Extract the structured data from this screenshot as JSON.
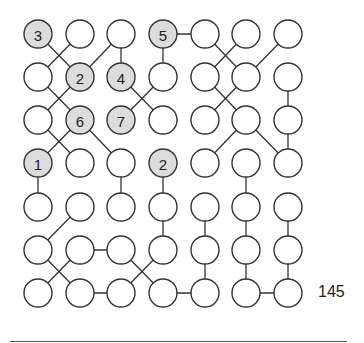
{
  "puzzle": {
    "type": "number-link grid",
    "rows": 7,
    "cols": 7,
    "col_x": [
      38,
      80,
      121,
      163,
      205,
      246,
      288
    ],
    "row_y": [
      34,
      77,
      120,
      163,
      207,
      250,
      293
    ],
    "radius": 14,
    "colors": {
      "shaded_fill": "#dcdcdc",
      "stroke": "#333333",
      "empty_fill": "#ffffff"
    },
    "clues": [
      {
        "r": 0,
        "c": 0,
        "value": "3"
      },
      {
        "r": 0,
        "c": 3,
        "value": "5"
      },
      {
        "r": 1,
        "c": 1,
        "value": "2"
      },
      {
        "r": 1,
        "c": 2,
        "value": "4"
      },
      {
        "r": 2,
        "c": 1,
        "value": "6"
      },
      {
        "r": 2,
        "c": 2,
        "value": "7"
      },
      {
        "r": 3,
        "c": 0,
        "value": "1"
      },
      {
        "r": 3,
        "c": 3,
        "value": "2"
      }
    ],
    "edges": [
      [
        [
          0,
          0
        ],
        [
          1,
          1
        ]
      ],
      [
        [
          0,
          1
        ],
        [
          1,
          0
        ]
      ],
      [
        [
          0,
          2
        ],
        [
          1,
          1
        ]
      ],
      [
        [
          0,
          2
        ],
        [
          1,
          2
        ]
      ],
      [
        [
          0,
          3
        ],
        [
          0,
          4
        ]
      ],
      [
        [
          0,
          3
        ],
        [
          1,
          3
        ]
      ],
      [
        [
          0,
          4
        ],
        [
          1,
          5
        ]
      ],
      [
        [
          0,
          5
        ],
        [
          1,
          4
        ]
      ],
      [
        [
          0,
          6
        ],
        [
          1,
          5
        ]
      ],
      [
        [
          1,
          0
        ],
        [
          2,
          1
        ]
      ],
      [
        [
          1,
          1
        ],
        [
          2,
          0
        ]
      ],
      [
        [
          1,
          2
        ],
        [
          2,
          3
        ]
      ],
      [
        [
          1,
          3
        ],
        [
          2,
          2
        ]
      ],
      [
        [
          1,
          4
        ],
        [
          2,
          5
        ]
      ],
      [
        [
          1,
          5
        ],
        [
          2,
          4
        ]
      ],
      [
        [
          1,
          6
        ],
        [
          2,
          6
        ]
      ],
      [
        [
          2,
          1
        ],
        [
          3,
          0
        ]
      ],
      [
        [
          2,
          0
        ],
        [
          3,
          1
        ]
      ],
      [
        [
          2,
          1
        ],
        [
          3,
          2
        ]
      ],
      [
        [
          2,
          5
        ],
        [
          3,
          4
        ]
      ],
      [
        [
          2,
          5
        ],
        [
          3,
          6
        ]
      ],
      [
        [
          2,
          6
        ],
        [
          3,
          6
        ]
      ],
      [
        [
          3,
          0
        ],
        [
          4,
          0
        ]
      ],
      [
        [
          3,
          2
        ],
        [
          4,
          2
        ]
      ],
      [
        [
          3,
          3
        ],
        [
          4,
          3
        ]
      ],
      [
        [
          3,
          5
        ],
        [
          4,
          5
        ]
      ],
      [
        [
          4,
          1
        ],
        [
          5,
          0
        ]
      ],
      [
        [
          4,
          3
        ],
        [
          5,
          3
        ]
      ],
      [
        [
          4,
          4
        ],
        [
          5,
          4
        ]
      ],
      [
        [
          4,
          5
        ],
        [
          5,
          5
        ]
      ],
      [
        [
          4,
          6
        ],
        [
          5,
          6
        ]
      ],
      [
        [
          5,
          0
        ],
        [
          6,
          1
        ]
      ],
      [
        [
          5,
          1
        ],
        [
          6,
          0
        ]
      ],
      [
        [
          5,
          1
        ],
        [
          5,
          2
        ]
      ],
      [
        [
          5,
          2
        ],
        [
          6,
          3
        ]
      ],
      [
        [
          5,
          3
        ],
        [
          6,
          2
        ]
      ],
      [
        [
          5,
          4
        ],
        [
          6,
          4
        ]
      ],
      [
        [
          5,
          5
        ],
        [
          6,
          5
        ]
      ],
      [
        [
          5,
          6
        ],
        [
          6,
          6
        ]
      ],
      [
        [
          6,
          1
        ],
        [
          6,
          2
        ]
      ],
      [
        [
          6,
          3
        ],
        [
          6,
          4
        ]
      ],
      [
        [
          6,
          5
        ],
        [
          6,
          6
        ]
      ]
    ]
  },
  "page": {
    "number": "145"
  }
}
